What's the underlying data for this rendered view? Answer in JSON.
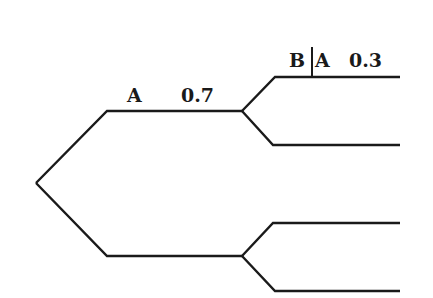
{
  "diagram": {
    "type": "probability-tree",
    "stroke_color": "#1a1a1a",
    "background": "#ffffff",
    "branch_labels": {
      "first_level_upper": {
        "event": "A",
        "probability": "0.7"
      },
      "second_level_upper_upper": {
        "event_left": "B",
        "separator": "|",
        "event_right": "A",
        "probability": "0.3"
      }
    },
    "nodes": [
      {
        "id": "root",
        "x": 36,
        "y": 183
      },
      {
        "id": "n1",
        "x": 242,
        "y": 111
      },
      {
        "id": "n2",
        "x": 242,
        "y": 256
      }
    ],
    "leaves": [
      {
        "id": "leaf1",
        "y": 77
      },
      {
        "id": "leaf2",
        "y": 145
      },
      {
        "id": "leaf3",
        "y": 223
      },
      {
        "id": "leaf4",
        "y": 291
      }
    ]
  }
}
